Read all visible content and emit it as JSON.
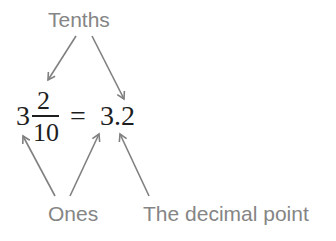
{
  "labels": {
    "top": "Tenths",
    "bottom_left": "Ones",
    "bottom_right": "The decimal point"
  },
  "equation": {
    "whole": "3",
    "numerator": "2",
    "denominator": "10",
    "equals": "=",
    "decimal": "3.2"
  },
  "colors": {
    "label_text": "#858585",
    "arrow": "#808080",
    "math_text": "#1e1e1e",
    "background": "#ffffff"
  },
  "arrows": [
    {
      "from_label": "Tenths",
      "to": "numerator"
    },
    {
      "from_label": "Tenths",
      "to": "decimal tenths digit"
    },
    {
      "from_label": "Ones",
      "to": "whole number"
    },
    {
      "from_label": "Ones",
      "to": "decimal ones digit"
    },
    {
      "from_label": "The decimal point",
      "to": "decimal point"
    }
  ]
}
